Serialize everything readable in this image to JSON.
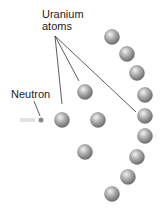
{
  "diagram": {
    "labels": {
      "uranium": [
        "Uranium",
        "atoms"
      ],
      "neutron": "Neutron"
    },
    "colors": {
      "atom_light": "#e6e6e6",
      "atom_mid": "#a8a8a8",
      "atom_dark": "#6e6e6e",
      "line": "#333333",
      "neutron": "#888888"
    },
    "neutron": {
      "x": 41,
      "y": 120,
      "r": 2.5
    },
    "atoms": [
      {
        "x": 62,
        "y": 120
      },
      {
        "x": 85,
        "y": 92
      },
      {
        "x": 98,
        "y": 120
      },
      {
        "x": 85,
        "y": 152
      },
      {
        "x": 112,
        "y": 37
      },
      {
        "x": 127,
        "y": 54
      },
      {
        "x": 137,
        "y": 73
      },
      {
        "x": 145,
        "y": 95
      },
      {
        "x": 145,
        "y": 116
      },
      {
        "x": 145,
        "y": 136
      },
      {
        "x": 137,
        "y": 157
      },
      {
        "x": 128,
        "y": 177
      },
      {
        "x": 112,
        "y": 194
      }
    ],
    "atom_radius": 7.5
  }
}
